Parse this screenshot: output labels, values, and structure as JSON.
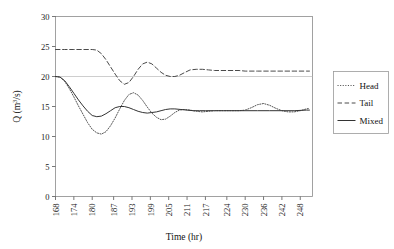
{
  "chart_data": {
    "type": "line",
    "title": "",
    "xlabel": "Time (hr)",
    "ylabel": "Q (m3/s)",
    "ylabel_parts": {
      "pre": "Q (m",
      "sup": "3",
      "post": "/s)"
    },
    "xlim": [
      168,
      252
    ],
    "ylim": [
      0,
      30
    ],
    "ytick_values": [
      0,
      5,
      10,
      15,
      20,
      25,
      30
    ],
    "ytick_labels": [
      "0",
      "5",
      "10",
      "15",
      "20",
      "25",
      "30"
    ],
    "xtick_labels": [
      "168",
      "174",
      "180",
      "187",
      "193",
      "199",
      "205",
      "211",
      "217",
      "224",
      "230",
      "236",
      "242",
      "248"
    ],
    "xtick_values": [
      168,
      174,
      180,
      187,
      193,
      199,
      205,
      211,
      217,
      224,
      230,
      236,
      242,
      248
    ],
    "grid": "horizontal gridline at y=20 only",
    "gridlines_y": [
      20
    ],
    "legend_position": "right-outside",
    "series": [
      {
        "name": "Head",
        "style": "dotted",
        "color": "#555555",
        "x": [
          168,
          169.5,
          171,
          172.5,
          174,
          175.5,
          177,
          178.5,
          180,
          181.5,
          183,
          184.5,
          186,
          187.5,
          189,
          190.5,
          192,
          193.5,
          195,
          196.5,
          198,
          199.5,
          201,
          202.5,
          204,
          205.5,
          207,
          208.5,
          210,
          212,
          214,
          216,
          218,
          220,
          222,
          224,
          226,
          228,
          230,
          232,
          234,
          236,
          238,
          240,
          242,
          244,
          246,
          248,
          250,
          251
        ],
        "y": [
          20.0,
          19.9,
          19.2,
          18.0,
          16.6,
          15.1,
          13.7,
          12.3,
          11.2,
          10.6,
          10.4,
          10.8,
          11.8,
          13.1,
          14.6,
          16.0,
          17.0,
          17.3,
          16.9,
          16.0,
          14.9,
          13.9,
          13.2,
          12.8,
          12.9,
          13.4,
          14.0,
          14.4,
          14.5,
          14.4,
          14.2,
          14.1,
          14.2,
          14.3,
          14.3,
          14.3,
          14.3,
          14.3,
          14.4,
          14.8,
          15.3,
          15.5,
          15.2,
          14.7,
          14.3,
          14.1,
          14.1,
          14.3,
          14.6,
          14.7
        ]
      },
      {
        "name": "Tail",
        "style": "dashed",
        "color": "#4a4a4a",
        "x": [
          168,
          171,
          174,
          177,
          180,
          181.5,
          183,
          184.5,
          186,
          187.5,
          189,
          190.5,
          192,
          193.5,
          195,
          196.5,
          198,
          199.5,
          201,
          202.5,
          204,
          205.5,
          207,
          208.5,
          210,
          212,
          214,
          216,
          218,
          220,
          222,
          224,
          226,
          228,
          230,
          234,
          238,
          242,
          246,
          250,
          251
        ],
        "y": [
          24.5,
          24.5,
          24.5,
          24.5,
          24.5,
          24.4,
          23.8,
          22.8,
          21.6,
          20.4,
          19.3,
          18.7,
          19.0,
          20.0,
          21.2,
          22.1,
          22.4,
          22.1,
          21.4,
          20.7,
          20.2,
          20.0,
          20.0,
          20.2,
          20.6,
          21.1,
          21.2,
          21.2,
          21.1,
          21.0,
          21.0,
          21.0,
          21.0,
          21.0,
          20.9,
          20.9,
          20.9,
          20.9,
          20.9,
          20.9,
          20.9
        ]
      },
      {
        "name": "Mixed",
        "style": "solid",
        "color": "#333333",
        "x": [
          168,
          169.5,
          171,
          172.5,
          174,
          175.5,
          177,
          178.5,
          180,
          181.5,
          183,
          184.5,
          186,
          187.5,
          189,
          190.5,
          192,
          193.5,
          195,
          196.5,
          198,
          199.5,
          201,
          202.5,
          204,
          205.5,
          207,
          209,
          211,
          213,
          215,
          217,
          220,
          223,
          226,
          230,
          234,
          238,
          242,
          246,
          250,
          251
        ],
        "y": [
          20.0,
          19.9,
          19.3,
          18.3,
          17.2,
          16.1,
          15.1,
          14.2,
          13.5,
          13.3,
          13.4,
          13.8,
          14.3,
          14.8,
          15.0,
          15.0,
          14.8,
          14.5,
          14.2,
          14.0,
          13.9,
          14.0,
          14.1,
          14.3,
          14.5,
          14.6,
          14.6,
          14.5,
          14.4,
          14.3,
          14.3,
          14.3,
          14.3,
          14.3,
          14.3,
          14.3,
          14.3,
          14.3,
          14.3,
          14.3,
          14.4,
          14.4
        ]
      }
    ]
  },
  "legend": {
    "items": [
      {
        "label": "Head"
      },
      {
        "label": "Tail"
      },
      {
        "label": "Mixed"
      }
    ]
  }
}
